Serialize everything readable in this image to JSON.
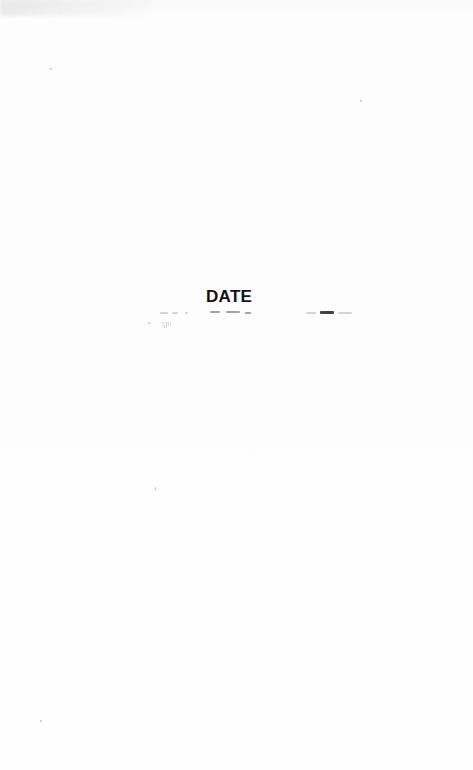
{
  "document": {
    "heading": "DATE",
    "body_text": "",
    "faint_mark": "ϛpɾ"
  }
}
